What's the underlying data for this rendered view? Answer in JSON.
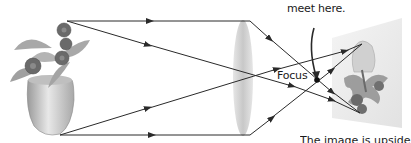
{
  "diagram": {
    "title_fragment": "meet here.",
    "focus_label": "Focus",
    "bottom_caption_fragment": "The image is upside",
    "colors": {
      "ray": "#2a2a2a",
      "lens": "#d4d4d4",
      "screen": "#eeeeee",
      "text": "#1a1a1a"
    },
    "elements": [
      "flower-pot-object",
      "convex-lens",
      "focus-point",
      "projection-screen",
      "inverted-image"
    ]
  }
}
